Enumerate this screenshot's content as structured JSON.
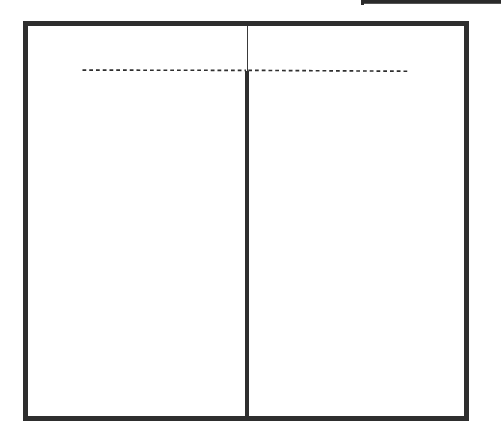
{
  "diagram": {
    "type": "two-column-wireframe",
    "columns": 2,
    "header_separator_style": "dashed",
    "divider_styles": {
      "header_region": "thin",
      "body_region": "thick"
    },
    "colors": {
      "stroke": "#2e2e2e",
      "background": "#ffffff"
    },
    "labels": []
  }
}
